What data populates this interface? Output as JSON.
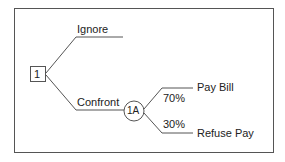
{
  "diagram": {
    "type": "decision-tree",
    "decision_node": {
      "label": "1",
      "shape": "square"
    },
    "chance_node": {
      "label": "1A",
      "shape": "circle"
    },
    "branches": {
      "ignore": {
        "label": "Ignore"
      },
      "confront": {
        "label": "Confront"
      },
      "pay_bill": {
        "label": "Pay Bill",
        "probability": "70%"
      },
      "refuse_pay": {
        "label": "Refuse Pay",
        "probability": "30%"
      }
    },
    "colors": {
      "line": "#555555",
      "text": "#222222",
      "background": "#ffffff"
    }
  }
}
